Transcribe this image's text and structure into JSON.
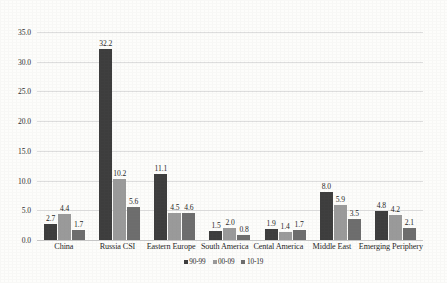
{
  "chart_data": {
    "type": "bar",
    "title": "",
    "subtitle": "",
    "xlabel": "",
    "ylabel": "",
    "ylim": [
      0,
      35
    ],
    "ytick_step": 5,
    "ytick_labels": [
      "0.0",
      "5.0",
      "10.0",
      "15.0",
      "20.0",
      "25.0",
      "30.0",
      "35.0"
    ],
    "grid": "horizontal",
    "legend_position": "bottom-center",
    "categories": [
      "China",
      "Russia CSI",
      "Eastern Europe",
      "South America",
      "Cental America",
      "Middle East",
      "Emerging Periphery"
    ],
    "series": [
      {
        "name": "90-99",
        "color": "#3d3d3d",
        "values": [
          2.7,
          32.2,
          11.1,
          1.5,
          1.9,
          8.0,
          4.8
        ],
        "labels": [
          "2.7",
          "32.2",
          "11.1",
          "1.5",
          "1.9",
          "8.0",
          "4.8"
        ]
      },
      {
        "name": "00-09",
        "color": "#9a9a9a",
        "values": [
          4.4,
          10.2,
          4.5,
          2.0,
          1.4,
          5.9,
          4.2
        ],
        "labels": [
          "4.4",
          "10.2",
          "4.5",
          "2.0",
          "1.4",
          "5.9",
          "4.2"
        ]
      },
      {
        "name": "10-19",
        "color": "#6d6d6d",
        "values": [
          1.7,
          5.6,
          4.6,
          0.8,
          1.7,
          3.5,
          2.1
        ],
        "labels": [
          "1.7",
          "5.6",
          "4.6",
          "0.8",
          "1.7",
          "3.5",
          "2.1"
        ]
      }
    ]
  },
  "legend": {
    "items": [
      {
        "label": "90-99",
        "color": "#3d3d3d"
      },
      {
        "label": "00-09",
        "color": "#9a9a9a"
      },
      {
        "label": "10-19",
        "color": "#6d6d6d"
      }
    ]
  },
  "axis": {
    "y_ticks": [
      "35.0",
      "30.0",
      "25.0",
      "20.0",
      "15.0",
      "10.0",
      "5.0",
      "0.0"
    ]
  },
  "colors": {
    "background": "#fdfdfb",
    "gridline": "#dedede",
    "baseline": "#c8c8c8",
    "text": "#1f1f1f"
  }
}
